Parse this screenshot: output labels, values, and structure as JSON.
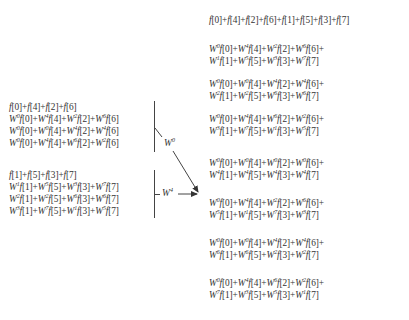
{
  "diagram": {
    "type": "fft-butterfly-combination",
    "left_groups": [
      {
        "id": "even",
        "lines": [
          {
            "terms": [
              {
                "w": null,
                "idx": 0
              },
              {
                "w": null,
                "idx": 4
              },
              {
                "w": null,
                "idx": 2
              },
              {
                "w": null,
                "idx": 6
              }
            ],
            "trailing_plus": false
          },
          {
            "terms": [
              {
                "w": 0,
                "idx": 0
              },
              {
                "w": 4,
                "idx": 4
              },
              {
                "w": 2,
                "idx": 2
              },
              {
                "w": 6,
                "idx": 6
              }
            ],
            "trailing_plus": false
          },
          {
            "terms": [
              {
                "w": 0,
                "idx": 0
              },
              {
                "w": 0,
                "idx": 4
              },
              {
                "w": 4,
                "idx": 2
              },
              {
                "w": 4,
                "idx": 6
              }
            ],
            "trailing_plus": false
          },
          {
            "terms": [
              {
                "w": 0,
                "idx": 0
              },
              {
                "w": 4,
                "idx": 4
              },
              {
                "w": 6,
                "idx": 2
              },
              {
                "w": 2,
                "idx": 6
              }
            ],
            "trailing_plus": false
          }
        ],
        "label": "W",
        "label_exp": "0"
      },
      {
        "id": "odd",
        "lines": [
          {
            "terms": [
              {
                "w": null,
                "idx": 1
              },
              {
                "w": null,
                "idx": 5
              },
              {
                "w": null,
                "idx": 3
              },
              {
                "w": null,
                "idx": 7
              }
            ],
            "trailing_plus": false
          },
          {
            "terms": [
              {
                "w": 1,
                "idx": 1
              },
              {
                "w": 5,
                "idx": 5
              },
              {
                "w": 3,
                "idx": 3
              },
              {
                "w": 7,
                "idx": 7
              }
            ],
            "trailing_plus": false
          },
          {
            "terms": [
              {
                "w": 2,
                "idx": 1
              },
              {
                "w": 2,
                "idx": 5
              },
              {
                "w": 6,
                "idx": 3
              },
              {
                "w": 6,
                "idx": 7
              }
            ],
            "trailing_plus": false
          },
          {
            "terms": [
              {
                "w": 3,
                "idx": 1
              },
              {
                "w": 7,
                "idx": 5
              },
              {
                "w": 1,
                "idx": 3
              },
              {
                "w": 5,
                "idx": 7
              }
            ],
            "trailing_plus": false
          }
        ],
        "label": "W",
        "label_exp": "4"
      }
    ],
    "right_rows": [
      {
        "lines": [
          {
            "terms": [
              {
                "w": null,
                "idx": 0
              },
              {
                "w": null,
                "idx": 4
              },
              {
                "w": null,
                "idx": 2
              },
              {
                "w": null,
                "idx": 6
              },
              {
                "w": null,
                "idx": 1
              },
              {
                "w": null,
                "idx": 5
              },
              {
                "w": null,
                "idx": 3
              },
              {
                "w": null,
                "idx": 7
              }
            ],
            "trailing_plus": false
          }
        ]
      },
      {
        "lines": [
          {
            "terms": [
              {
                "w": 0,
                "idx": 0
              },
              {
                "w": 4,
                "idx": 4
              },
              {
                "w": 2,
                "idx": 2
              },
              {
                "w": 6,
                "idx": 6
              }
            ],
            "trailing_plus": true
          },
          {
            "terms": [
              {
                "w": 1,
                "idx": 1
              },
              {
                "w": 5,
                "idx": 5
              },
              {
                "w": 3,
                "idx": 3
              },
              {
                "w": 7,
                "idx": 7
              }
            ],
            "trailing_plus": false
          }
        ]
      },
      {
        "lines": [
          {
            "terms": [
              {
                "w": 0,
                "idx": 0
              },
              {
                "w": 0,
                "idx": 4
              },
              {
                "w": 4,
                "idx": 2
              },
              {
                "w": 4,
                "idx": 6
              }
            ],
            "trailing_plus": true
          },
          {
            "terms": [
              {
                "w": 2,
                "idx": 1
              },
              {
                "w": 2,
                "idx": 5
              },
              {
                "w": 6,
                "idx": 3
              },
              {
                "w": 6,
                "idx": 7
              }
            ],
            "trailing_plus": false
          }
        ]
      },
      {
        "lines": [
          {
            "terms": [
              {
                "w": 0,
                "idx": 0
              },
              {
                "w": 4,
                "idx": 4
              },
              {
                "w": 6,
                "idx": 2
              },
              {
                "w": 2,
                "idx": 6
              }
            ],
            "trailing_plus": true
          },
          {
            "terms": [
              {
                "w": 3,
                "idx": 1
              },
              {
                "w": 7,
                "idx": 5
              },
              {
                "w": 1,
                "idx": 3
              },
              {
                "w": 5,
                "idx": 7
              }
            ],
            "trailing_plus": false
          }
        ]
      },
      {
        "lines": [
          {
            "terms": [
              {
                "w": 0,
                "idx": 0
              },
              {
                "w": 0,
                "idx": 4
              },
              {
                "w": 0,
                "idx": 2
              },
              {
                "w": 0,
                "idx": 6
              }
            ],
            "trailing_plus": true
          },
          {
            "terms": [
              {
                "w": 4,
                "idx": 1
              },
              {
                "w": 4,
                "idx": 5
              },
              {
                "w": 4,
                "idx": 3
              },
              {
                "w": 4,
                "idx": 7
              }
            ],
            "trailing_plus": false
          }
        ]
      },
      {
        "lines": [
          {
            "terms": [
              {
                "w": 0,
                "idx": 0
              },
              {
                "w": 4,
                "idx": 4
              },
              {
                "w": 2,
                "idx": 2
              },
              {
                "w": 6,
                "idx": 6
              }
            ],
            "trailing_plus": true
          },
          {
            "terms": [
              {
                "w": 5,
                "idx": 1
              },
              {
                "w": 1,
                "idx": 5
              },
              {
                "w": 7,
                "idx": 3
              },
              {
                "w": 3,
                "idx": 7
              }
            ],
            "trailing_plus": false
          }
        ]
      },
      {
        "lines": [
          {
            "terms": [
              {
                "w": 0,
                "idx": 0
              },
              {
                "w": 0,
                "idx": 4
              },
              {
                "w": 4,
                "idx": 2
              },
              {
                "w": 4,
                "idx": 6
              }
            ],
            "trailing_plus": true
          },
          {
            "terms": [
              {
                "w": 6,
                "idx": 1
              },
              {
                "w": 6,
                "idx": 5
              },
              {
                "w": 2,
                "idx": 3
              },
              {
                "w": 2,
                "idx": 7
              }
            ],
            "trailing_plus": false
          }
        ]
      },
      {
        "lines": [
          {
            "terms": [
              {
                "w": 0,
                "idx": 0
              },
              {
                "w": 4,
                "idx": 4
              },
              {
                "w": 6,
                "idx": 2
              },
              {
                "w": 2,
                "idx": 6
              }
            ],
            "trailing_plus": true
          },
          {
            "terms": [
              {
                "w": 7,
                "idx": 1
              },
              {
                "w": 3,
                "idx": 5
              },
              {
                "w": 5,
                "idx": 3
              },
              {
                "w": 1,
                "idx": 7
              }
            ],
            "trailing_plus": false
          }
        ]
      }
    ],
    "symbols": {
      "fn": "f",
      "W": "W",
      "plus": "+"
    },
    "colors": {
      "text": "#333333",
      "lines": "#444444",
      "background": "#ffffff"
    }
  }
}
